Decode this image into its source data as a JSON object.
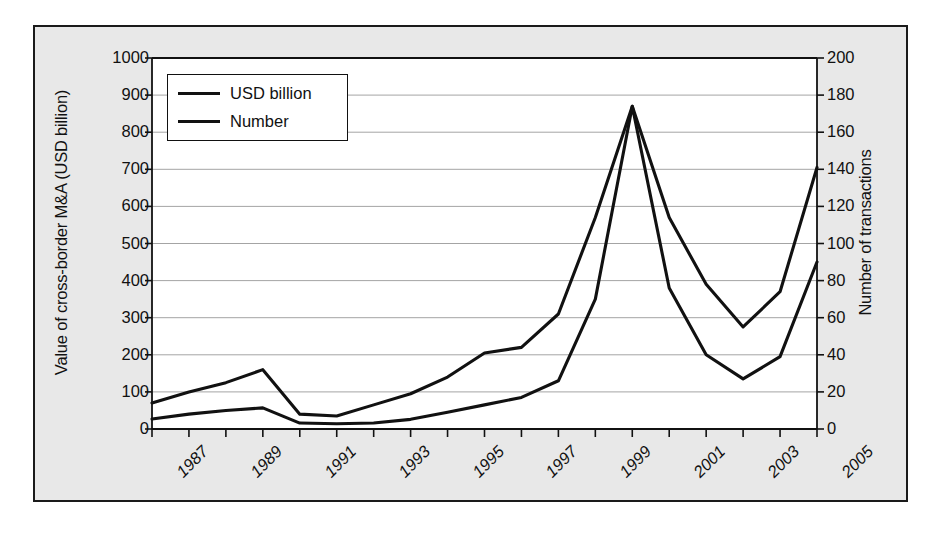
{
  "figure": {
    "background": "#e8e8e8",
    "border_color": "#1a1a1a",
    "plot_background": "#ffffff"
  },
  "legend": {
    "items": [
      {
        "label": "USD billion",
        "color": "#111111"
      },
      {
        "label": "Number",
        "color": "#111111"
      }
    ]
  },
  "axes": {
    "left_title": "Value of cross-border M&A (USD billion)",
    "right_title": "Number of transactions",
    "left_ticks": [
      "1000",
      "900",
      "800",
      "700",
      "600",
      "500",
      "400",
      "300",
      "200",
      "100",
      "0"
    ],
    "right_ticks": [
      "200",
      "180",
      "160",
      "140",
      "120",
      "100",
      "80",
      "60",
      "40",
      "20",
      "0"
    ],
    "x_ticks": [
      "1987",
      "1989",
      "1991",
      "1993",
      "1995",
      "1997",
      "1999",
      "2001",
      "2003",
      "2005"
    ]
  },
  "chart_data": {
    "type": "line",
    "title": "",
    "xlabel": "",
    "ylabel": "Value of cross-border M&A (USD billion)",
    "y2label": "Number of transactions",
    "grid": true,
    "legend_position": "top-left",
    "ylim": [
      0,
      1000
    ],
    "y2lim": [
      0,
      200
    ],
    "x": [
      1987,
      1988,
      1989,
      1990,
      1991,
      1992,
      1993,
      1994,
      1995,
      1996,
      1997,
      1998,
      1999,
      2000,
      2001,
      2002,
      2003,
      2004,
      2005
    ],
    "xlim": [
      1987,
      2005
    ],
    "series": [
      {
        "name": "USD billion",
        "axis": "left",
        "color": "#111111",
        "values": [
          27,
          40,
          50,
          57,
          16,
          14,
          16,
          26,
          45,
          65,
          85,
          130,
          350,
          870,
          380,
          200,
          135,
          195,
          450
        ]
      },
      {
        "name": "Number",
        "axis": "right",
        "color": "#111111",
        "values": [
          14,
          20,
          25,
          32,
          8,
          7,
          13,
          19,
          28,
          41,
          44,
          62,
          114,
          174,
          114,
          78,
          55,
          74,
          141
        ]
      }
    ]
  }
}
